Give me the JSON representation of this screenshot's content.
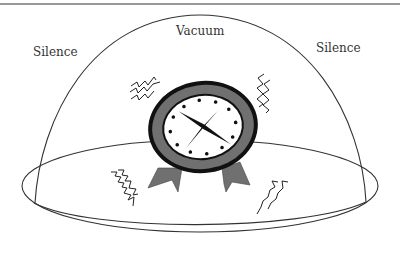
{
  "diagram": {
    "labels": {
      "left": "Silence",
      "top": "Vacuum",
      "right": "Silence"
    },
    "components": [
      {
        "name": "bell-jar",
        "shape": "dome"
      },
      {
        "name": "base-plate",
        "shape": "ellipse"
      },
      {
        "name": "alarm-clock",
        "shape": "circle",
        "hour_markers": 12
      },
      {
        "name": "vibration-marks",
        "count": 4
      }
    ],
    "colors": {
      "line": "#333333",
      "clock_ring": "#707070",
      "clock_rim": "#111111",
      "clock_face": "#ffffff",
      "background": "#ffffff"
    }
  }
}
